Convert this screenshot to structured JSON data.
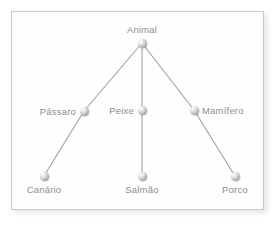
{
  "diagram": {
    "type": "tree",
    "colors": {
      "background": "#ffffff",
      "panel": "#fefefe",
      "border": "#c9c9c9",
      "text": "#8d8d8d",
      "edge": "#a0a0a0",
      "node": "#b4b4b4"
    },
    "nodes": [
      {
        "id": "animal",
        "label": "Animal",
        "x": 142,
        "y": 43,
        "label_pos": "above",
        "label_dx": 0,
        "label_dy": -8
      },
      {
        "id": "passaro",
        "label": "Pássaro",
        "x": 84,
        "y": 111,
        "label_pos": "left",
        "label_dx": -8,
        "label_dy": 0
      },
      {
        "id": "peixe",
        "label": "Peixe",
        "x": 142,
        "y": 110,
        "label_pos": "left",
        "label_dx": -8,
        "label_dy": 0
      },
      {
        "id": "mamifero",
        "label": "Mamífero",
        "x": 194,
        "y": 110,
        "label_pos": "right",
        "label_dx": 8,
        "label_dy": 0
      },
      {
        "id": "canario",
        "label": "Canário",
        "x": 44,
        "y": 176,
        "label_pos": "below",
        "label_dx": 0,
        "label_dy": 8
      },
      {
        "id": "salmao",
        "label": "Salmão",
        "x": 142,
        "y": 176,
        "label_pos": "below",
        "label_dx": 0,
        "label_dy": 8
      },
      {
        "id": "porco",
        "label": "Porco",
        "x": 235,
        "y": 176,
        "label_pos": "below",
        "label_dx": 0,
        "label_dy": 8
      }
    ],
    "edges": [
      {
        "from": "animal",
        "to": "passaro"
      },
      {
        "from": "animal",
        "to": "peixe"
      },
      {
        "from": "animal",
        "to": "mamifero"
      },
      {
        "from": "passaro",
        "to": "canario"
      },
      {
        "from": "peixe",
        "to": "salmao"
      },
      {
        "from": "mamifero",
        "to": "porco"
      }
    ]
  }
}
